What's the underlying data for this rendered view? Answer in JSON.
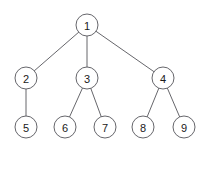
{
  "figure": {
    "background_color": "#ffffff",
    "node_fill": "#ffffff",
    "node_stroke": "#55555a",
    "edge_color": "#55555a",
    "label_color": "#1a1a1a",
    "node_radius": 11
  },
  "chart_data": {
    "type": "diagram",
    "title": "",
    "nodes": [
      {
        "id": "1",
        "label": "1",
        "x": 87,
        "y": 25,
        "level": 0
      },
      {
        "id": "2",
        "label": "2",
        "x": 26,
        "y": 78,
        "level": 1
      },
      {
        "id": "3",
        "label": "3",
        "x": 87,
        "y": 78,
        "level": 1
      },
      {
        "id": "4",
        "label": "4",
        "x": 163,
        "y": 78,
        "level": 1
      },
      {
        "id": "5",
        "label": "5",
        "x": 26,
        "y": 127,
        "level": 2
      },
      {
        "id": "6",
        "label": "6",
        "x": 65,
        "y": 127,
        "level": 2
      },
      {
        "id": "7",
        "label": "7",
        "x": 105,
        "y": 127,
        "level": 2
      },
      {
        "id": "8",
        "label": "8",
        "x": 143,
        "y": 127,
        "level": 2
      },
      {
        "id": "9",
        "label": "9",
        "x": 184,
        "y": 127,
        "level": 2
      }
    ],
    "edges": [
      {
        "from": "1",
        "to": "2"
      },
      {
        "from": "1",
        "to": "3"
      },
      {
        "from": "1",
        "to": "4"
      },
      {
        "from": "2",
        "to": "5"
      },
      {
        "from": "3",
        "to": "6"
      },
      {
        "from": "3",
        "to": "7"
      },
      {
        "from": "4",
        "to": "8"
      },
      {
        "from": "4",
        "to": "9"
      }
    ]
  }
}
